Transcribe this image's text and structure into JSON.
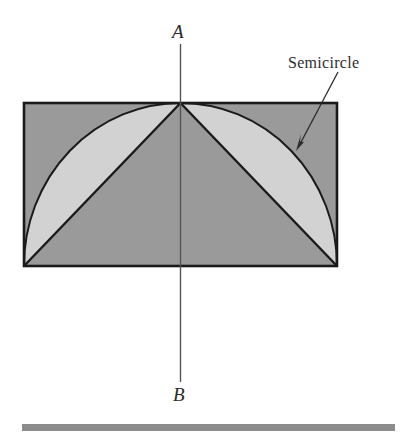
{
  "figure": {
    "labels": {
      "apex_label": "A",
      "bottom_label": "B",
      "callout_label": "Semicircle"
    },
    "colors": {
      "background": "#ffffff",
      "rectangle_fill": "#9a9a9a",
      "lune_fill": "#d2d2d2",
      "stroke": "#1a1a1a",
      "axis_line": "#555555",
      "bottom_rule": "#8c8c8c",
      "text": "#2b2b2b"
    },
    "geometry": {
      "rectangle": {
        "left": 24,
        "top": 103,
        "right": 337,
        "bottom": 266,
        "width": 313,
        "height": 163
      },
      "apex": {
        "x": 180.5,
        "y": 103
      },
      "bottom_left_corner": {
        "x": 24,
        "y": 266
      },
      "bottom_right_corner": {
        "x": 337,
        "y": 266
      },
      "arc": {
        "description": "semicircular arc from bottom-left corner up through apex down to bottom-right corner",
        "radius_x": 156.5,
        "radius_y": 163
      },
      "chords": [
        {
          "from": "apex",
          "to": "bottom_left_corner"
        },
        {
          "from": "apex",
          "to": "bottom_right_corner"
        }
      ],
      "axis_line": {
        "x": 180.5,
        "y_top": 44,
        "y_bottom": 382
      },
      "callout_arrow": {
        "from_x": 338,
        "from_y": 72,
        "to_x": 296,
        "to_y": 150
      },
      "bottom_rule": {
        "left": 22,
        "top": 424,
        "width": 373,
        "height": 7
      }
    }
  }
}
